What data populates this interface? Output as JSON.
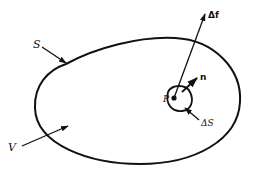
{
  "diagram": {
    "type": "surface-volume-schematic",
    "colors": {
      "stroke": "#111111",
      "background": "#ffffff"
    },
    "labels": {
      "surface": "S",
      "volume": "V",
      "point": "P",
      "force": "Δf",
      "normal": "n",
      "area_element": "ΔS"
    },
    "elements": [
      {
        "id": "surface-boundary",
        "kind": "closed-curve",
        "label": "S"
      },
      {
        "id": "volume-region",
        "kind": "region",
        "label": "V"
      },
      {
        "id": "small-area",
        "kind": "small-closed-curve",
        "label": "ΔS"
      },
      {
        "id": "point",
        "kind": "point",
        "label": "P"
      },
      {
        "id": "force-vector",
        "kind": "arrow",
        "label": "Δf"
      },
      {
        "id": "normal-vector",
        "kind": "arrow",
        "label": "n"
      }
    ]
  }
}
